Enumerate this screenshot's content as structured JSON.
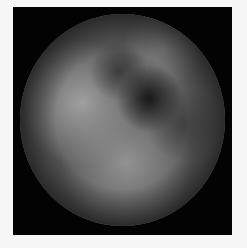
{
  "image": {
    "description": "Grayscale circular microscopy/endoscopic view on black square background",
    "background_color": "#f7f7f7",
    "frame_color": "#030303",
    "disc_base_color": "#5a5a5a",
    "regions": [
      {
        "name": "bright-upper-left",
        "cx": 0.3,
        "cy": 0.42,
        "r": 0.28,
        "color": "#9a9a9a"
      },
      {
        "name": "bright-lower-center",
        "cx": 0.52,
        "cy": 0.68,
        "r": 0.3,
        "color": "#8e8e8e"
      },
      {
        "name": "light-upper-right",
        "cx": 0.7,
        "cy": 0.18,
        "r": 0.18,
        "color": "#7c7c7c"
      },
      {
        "name": "dark-center-right",
        "cx": 0.63,
        "cy": 0.4,
        "r": 0.14,
        "color": "#1e1e1e"
      },
      {
        "name": "dark-vignette-edge",
        "color": "#2a2a2a"
      }
    ]
  }
}
